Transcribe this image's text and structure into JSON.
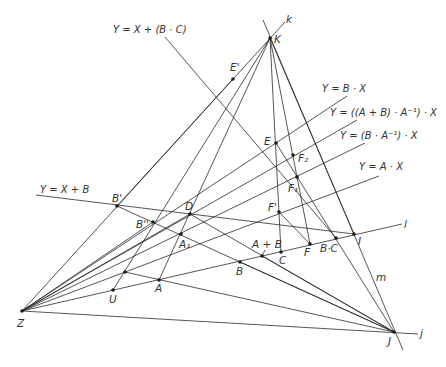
{
  "figure": {
    "width": 446,
    "height": 367,
    "background": "#ffffff",
    "stroke": "#2a2a2a",
    "points": [
      {
        "id": "Z",
        "label": "Z",
        "x": 22,
        "y": 311,
        "lx": 17,
        "ly": 327
      },
      {
        "id": "J",
        "label": "J",
        "x": 394,
        "y": 332,
        "lx": 388,
        "ly": 345
      },
      {
        "id": "K",
        "label": "K",
        "x": 270,
        "y": 38,
        "lx": 274,
        "ly": 43
      },
      {
        "id": "I",
        "label": "I",
        "x": 354,
        "y": 234,
        "lx": 358,
        "ly": 245
      },
      {
        "id": "Ep",
        "label": "E'",
        "x": 233,
        "y": 79,
        "lx": 230,
        "ly": 71
      },
      {
        "id": "E",
        "label": "E",
        "x": 276,
        "y": 143,
        "lx": 264,
        "ly": 145
      },
      {
        "id": "F2",
        "label": "F₂",
        "x": 293,
        "y": 155,
        "lx": 298,
        "ly": 162
      },
      {
        "id": "F1",
        "label": "F₁",
        "x": 297,
        "y": 177,
        "lx": 288,
        "ly": 192
      },
      {
        "id": "Fp",
        "label": "F'",
        "x": 279,
        "y": 212,
        "lx": 268,
        "ly": 211
      },
      {
        "id": "C",
        "label": "C",
        "x": 281,
        "y": 252,
        "lx": 279,
        "ly": 264
      },
      {
        "id": "F",
        "label": "F",
        "x": 310,
        "y": 244,
        "lx": 304,
        "ly": 256
      },
      {
        "id": "BC",
        "label": "B·C",
        "x": 336,
        "y": 238,
        "lx": 320,
        "ly": 252
      },
      {
        "id": "ApB",
        "label": "A + B",
        "x": 262,
        "y": 256,
        "lx": 252,
        "ly": 248
      },
      {
        "id": "B",
        "label": "B",
        "x": 240,
        "y": 262,
        "lx": 236,
        "ly": 275
      },
      {
        "id": "A",
        "label": "A",
        "x": 159,
        "y": 280,
        "lx": 155,
        "ly": 292
      },
      {
        "id": "U",
        "label": "U",
        "x": 113,
        "y": 290,
        "lx": 109,
        "ly": 303
      },
      {
        "id": "P0",
        "label": "",
        "x": 125,
        "y": 272,
        "lx": 0,
        "ly": 0
      },
      {
        "id": "A1",
        "label": "A₁",
        "x": 181,
        "y": 234,
        "lx": 179,
        "ly": 248
      },
      {
        "id": "D",
        "label": "D",
        "x": 190,
        "y": 214,
        "lx": 185,
        "ly": 210
      },
      {
        "id": "Bpp",
        "label": "B''",
        "x": 153,
        "y": 222,
        "lx": 136,
        "ly": 228
      },
      {
        "id": "Bp",
        "label": "B'",
        "x": 117,
        "y": 206,
        "lx": 112,
        "ly": 202
      }
    ],
    "line_labels": [
      {
        "id": "k",
        "text": "k",
        "x": 286,
        "y": 23
      },
      {
        "id": "l",
        "text": "l",
        "x": 404,
        "y": 228
      },
      {
        "id": "m",
        "text": "m",
        "x": 376,
        "y": 281
      },
      {
        "id": "j",
        "text": "j",
        "x": 420,
        "y": 337
      }
    ],
    "equations": [
      {
        "id": "eq-x-plus-bc",
        "text": "Y = X + (B · C)",
        "x": 113,
        "y": 33
      },
      {
        "id": "eq-b-x",
        "text": "Y = B · X",
        "x": 322,
        "y": 92
      },
      {
        "id": "eq-apb-ainv-x",
        "text": "Y = ((A + B) · A⁻¹) · X",
        "x": 330,
        "y": 116
      },
      {
        "id": "eq-b-ainv-x",
        "text": "Y = (B · A⁻¹) · X",
        "x": 340,
        "y": 139
      },
      {
        "id": "eq-a-x",
        "text": "Y = A · X",
        "x": 359,
        "y": 170
      },
      {
        "id": "eq-x-plus-b",
        "text": "Y = X + B",
        "x": 40,
        "y": 193
      }
    ],
    "segments": [
      {
        "x1": 22,
        "y1": 311,
        "x2": 418,
        "y2": 334
      },
      {
        "x1": 22,
        "y1": 311,
        "x2": 402,
        "y2": 224
      },
      {
        "x1": 22,
        "y1": 311,
        "x2": 379,
        "y2": 176
      },
      {
        "x1": 22,
        "y1": 311,
        "x2": 365,
        "y2": 143
      },
      {
        "x1": 22,
        "y1": 311,
        "x2": 357,
        "y2": 120
      },
      {
        "x1": 22,
        "y1": 311,
        "x2": 347,
        "y2": 96
      },
      {
        "x1": 22,
        "y1": 311,
        "x2": 285,
        "y2": 22
      },
      {
        "x1": 22,
        "y1": 311,
        "x2": 153,
        "y2": 222
      },
      {
        "x1": 22,
        "y1": 311,
        "x2": 190,
        "y2": 214
      },
      {
        "x1": 263,
        "y1": 20,
        "x2": 403,
        "y2": 350
      },
      {
        "x1": 36,
        "y1": 195,
        "x2": 354,
        "y2": 234
      },
      {
        "x1": 165,
        "y1": 37,
        "x2": 336,
        "y2": 238
      },
      {
        "x1": 270,
        "y1": 38,
        "x2": 113,
        "y2": 290
      },
      {
        "x1": 270,
        "y1": 38,
        "x2": 159,
        "y2": 280
      },
      {
        "x1": 270,
        "y1": 38,
        "x2": 281,
        "y2": 252
      },
      {
        "x1": 270,
        "y1": 38,
        "x2": 310,
        "y2": 244
      },
      {
        "x1": 270,
        "y1": 38,
        "x2": 354,
        "y2": 234
      },
      {
        "x1": 117,
        "y1": 206,
        "x2": 394,
        "y2": 332
      },
      {
        "x1": 125,
        "y1": 272,
        "x2": 394,
        "y2": 332
      },
      {
        "x1": 190,
        "y1": 214,
        "x2": 394,
        "y2": 332
      },
      {
        "x1": 276,
        "y1": 143,
        "x2": 394,
        "y2": 332
      },
      {
        "x1": 279,
        "y1": 212,
        "x2": 310,
        "y2": 244
      },
      {
        "x1": 117,
        "y1": 206,
        "x2": 233,
        "y2": 79
      },
      {
        "x1": 240,
        "y1": 262,
        "x2": 394,
        "y2": 332
      },
      {
        "x1": 262,
        "y1": 256,
        "x2": 394,
        "y2": 332
      },
      {
        "x1": 262,
        "y1": 256,
        "x2": 265,
        "y2": 250
      }
    ]
  }
}
